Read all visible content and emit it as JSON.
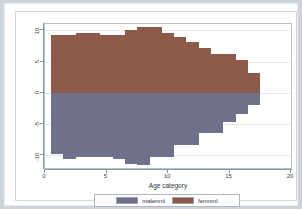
{
  "chart_data": {
    "type": "bar",
    "title": "",
    "subtitle": "",
    "xlabel": "Age category",
    "ylabel": "",
    "xlim": [
      0,
      20
    ],
    "ylim": [
      -12,
      11
    ],
    "xticks": [
      0,
      5,
      10,
      15,
      20
    ],
    "yticks": [
      10,
      5,
      0,
      -5,
      -10
    ],
    "xticklabels": [
      "0",
      "5",
      "10",
      "15",
      "20"
    ],
    "yticklabels": [
      "10",
      "5",
      "0",
      "-5",
      "-10"
    ],
    "grid": true,
    "grid_axis": "y",
    "legend_position": "bottom",
    "orientation": "population-pyramid",
    "categories": [
      1,
      2,
      3,
      4,
      5,
      6,
      7,
      8,
      9,
      10,
      11,
      12,
      13,
      14,
      15,
      16,
      17
    ],
    "series": [
      {
        "name": "femnml",
        "color": "#8d5a49",
        "direction": "up",
        "values": [
          9.3,
          9.3,
          9.6,
          9.6,
          9.3,
          9.3,
          10.0,
          10.6,
          10.6,
          9.6,
          9.0,
          8.2,
          7.1,
          6.2,
          6.2,
          5.2,
          3.2
        ]
      },
      {
        "name": "malenml",
        "color": "#6f7089",
        "direction": "down",
        "values": [
          -9.8,
          -10.6,
          -10.3,
          -10.3,
          -10.3,
          -10.6,
          -11.3,
          -11.6,
          -10.3,
          -10.3,
          -8.4,
          -8.4,
          -6.4,
          -6.4,
          -4.6,
          -3.4,
          -2.0
        ]
      }
    ]
  },
  "legend": {
    "items": [
      {
        "label": "malenml",
        "color": "#6f7089",
        "key": "male"
      },
      {
        "label": "femnml",
        "color": "#8d5a49",
        "key": "female"
      }
    ]
  },
  "axis": {
    "x_title": "Age category"
  },
  "colors": {
    "male": "#6f7089",
    "female": "#8d5a49",
    "frame": "#b9c3cc",
    "grid": "#e3e8ec",
    "background": "#ffffff",
    "page": "#cfd4da"
  }
}
